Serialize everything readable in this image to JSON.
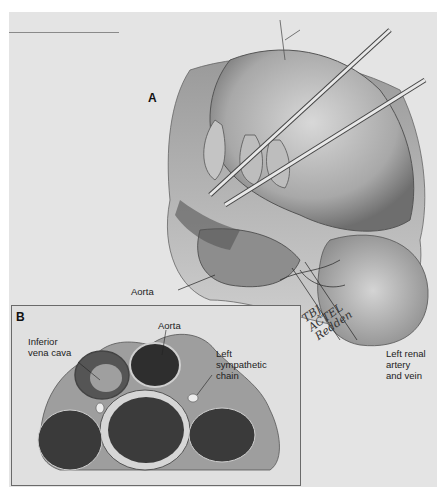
{
  "figure": {
    "panel_a": {
      "letter": "A",
      "labels": {
        "aorta": "Aorta",
        "left_renal": [
          "Left renal",
          "artery",
          "and vein"
        ]
      }
    },
    "panel_b": {
      "letter": "B",
      "labels": {
        "ivc": [
          "Inferior",
          "vena cava"
        ],
        "aorta": "Aorta",
        "sympathetic": [
          "Left",
          "sympathetic",
          "chain"
        ]
      }
    },
    "signature": [
      "TBJ",
      "ACTEL",
      "Redden"
    ],
    "colors": {
      "plate": "#e4e4e4",
      "ink": "#222222",
      "tissue_dark": "#3a3a3a",
      "tissue_mid": "#8a8a8a",
      "tissue_light": "#cfcfcf"
    }
  }
}
